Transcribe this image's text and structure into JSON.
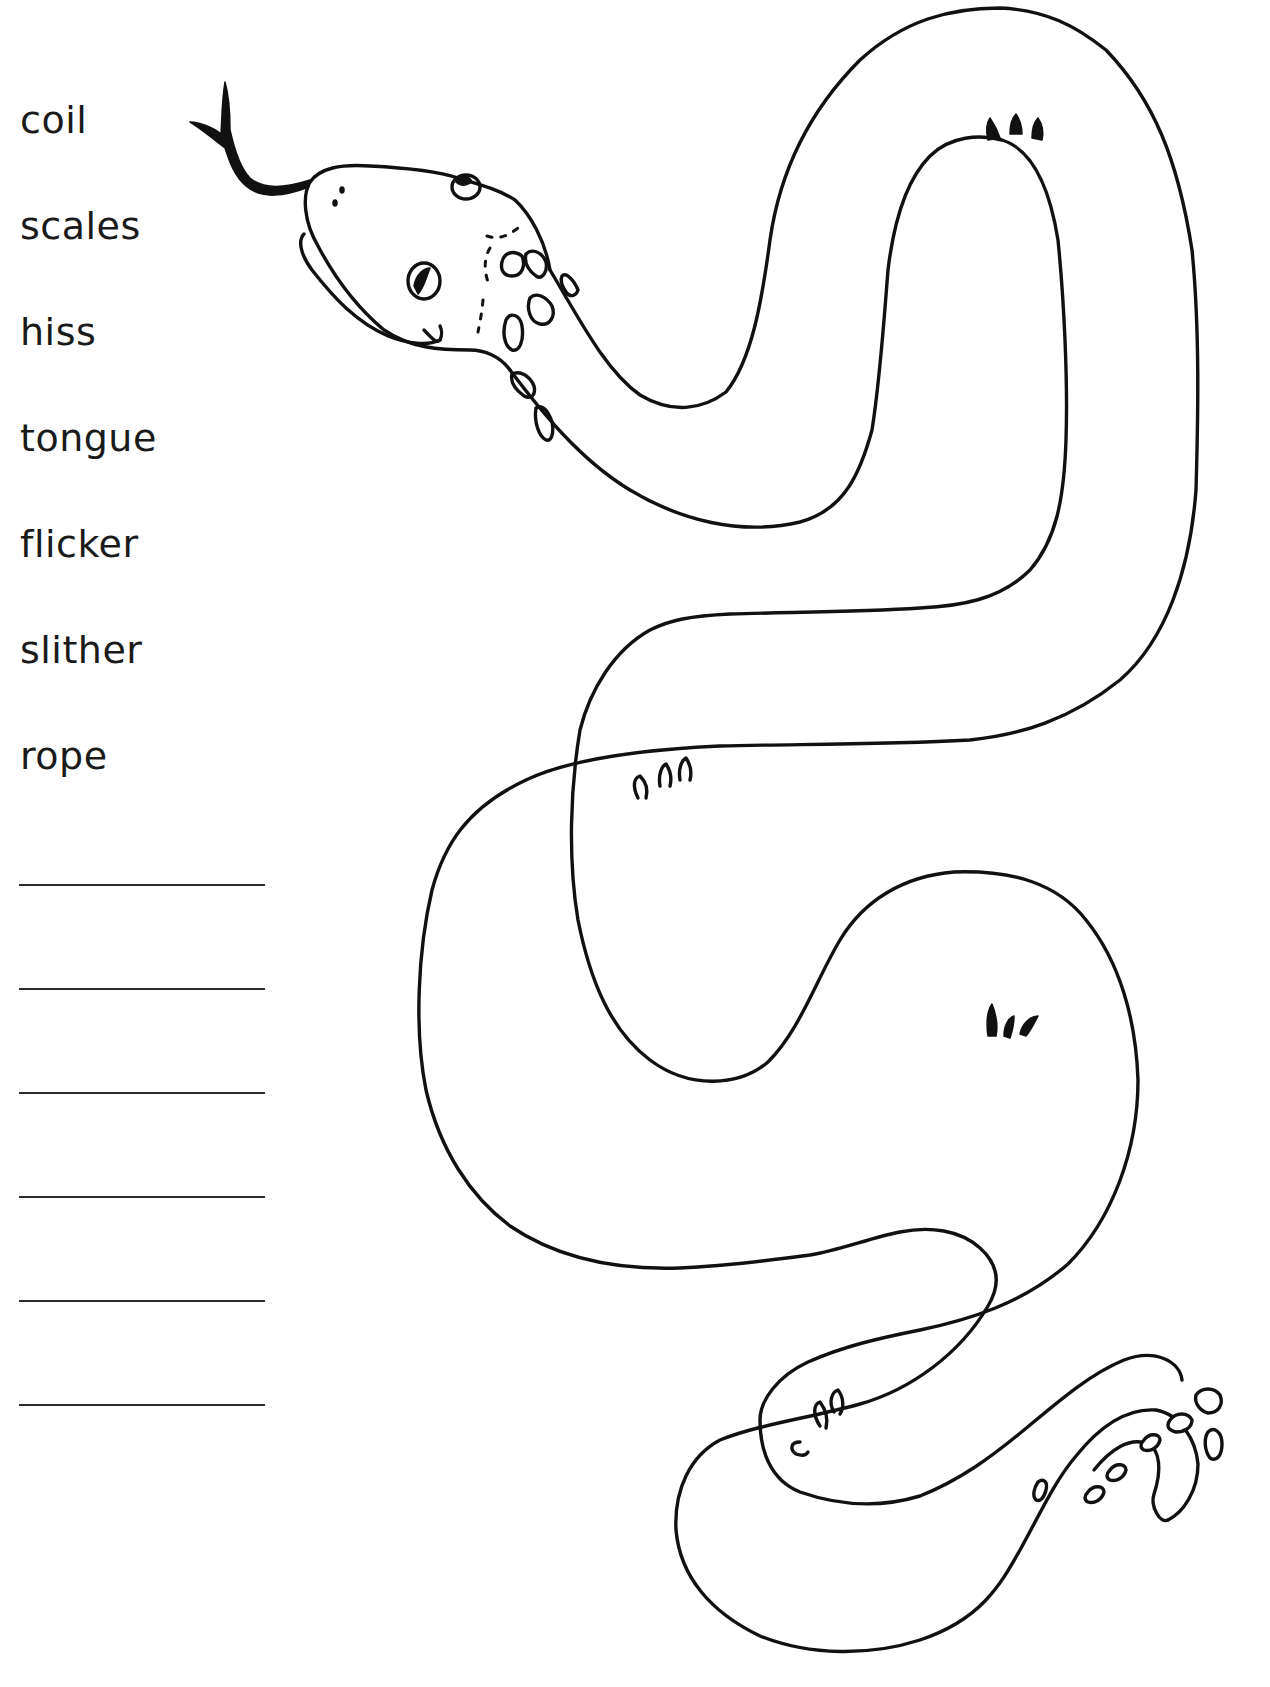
{
  "worksheet": {
    "word_bank": [
      {
        "text": "coil"
      },
      {
        "text": "scales"
      },
      {
        "text": "hiss"
      },
      {
        "text": "tongue"
      },
      {
        "text": "flicker"
      },
      {
        "text": "slither"
      },
      {
        "text": "rope"
      }
    ],
    "answer_lines_count": 6,
    "illustration": {
      "subject": "snake",
      "style": "black line-art colouring outline",
      "icon": "snake-icon"
    },
    "colors": {
      "ink": "#111111",
      "paper": "#ffffff"
    }
  }
}
